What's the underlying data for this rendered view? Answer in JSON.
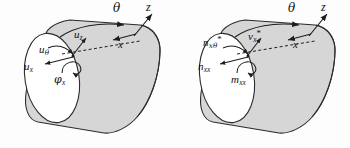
{
  "figure": {
    "panel_count": 2,
    "style": {
      "shell_fill": "#d6d6d6",
      "end_cap_fill": "#ffffff",
      "outline": "#2b2b2b",
      "label_color": "#111111",
      "background": "#fdfdfd"
    }
  },
  "panels": [
    {
      "id": "left-panel",
      "name": "displacement-panel",
      "axes": {
        "theta": "θ",
        "z": "z",
        "x": "x"
      },
      "labels": [
        {
          "key": "u_z",
          "base": "u",
          "sub": "z",
          "star": ""
        },
        {
          "key": "u_theta",
          "base": "u",
          "sub": "θ",
          "star": ""
        },
        {
          "key": "u_x",
          "base": "u",
          "sub": "x",
          "star": ""
        },
        {
          "key": "phi_x",
          "base": "φ",
          "sub": "x",
          "star": ""
        }
      ]
    },
    {
      "id": "right-panel",
      "name": "stress-resultant-panel",
      "axes": {
        "theta": "θ",
        "z": "z",
        "x": "x"
      },
      "labels": [
        {
          "key": "n_xtheta_star",
          "base": "n",
          "sub": "xθ",
          "star": "*"
        },
        {
          "key": "v_x_star",
          "base": "v",
          "sub": "x",
          "star": "*"
        },
        {
          "key": "n_xx",
          "base": "n",
          "sub": "xx",
          "star": ""
        },
        {
          "key": "m_xx",
          "base": "m",
          "sub": "xx",
          "star": ""
        }
      ]
    }
  ]
}
